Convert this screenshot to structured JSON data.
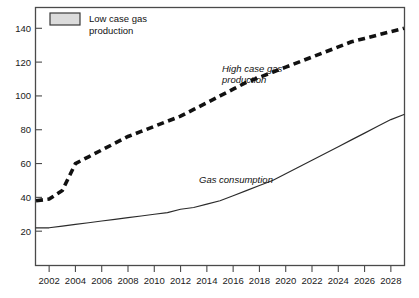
{
  "chart_data": {
    "type": "line",
    "title": "",
    "xlabel": "",
    "ylabel": "",
    "xlim": [
      2001,
      2029
    ],
    "ylim": [
      0,
      152
    ],
    "grid": false,
    "legend_position": "top-left",
    "x_ticks": [
      "2002",
      "2004",
      "2006",
      "2008",
      "2010",
      "2012",
      "2014",
      "2016",
      "2018",
      "2020",
      "2022",
      "2024",
      "2026",
      "2028"
    ],
    "x_tick_values": [
      2002,
      2004,
      2006,
      2008,
      2010,
      2012,
      2014,
      2016,
      2018,
      2020,
      2022,
      2024,
      2026,
      2028
    ],
    "y_ticks": [
      "20",
      "40",
      "60",
      "80",
      "100",
      "120",
      "140"
    ],
    "y_tick_values": [
      20,
      40,
      60,
      80,
      100,
      120,
      140
    ],
    "x": [
      2001,
      2002,
      2003,
      2004,
      2005,
      2006,
      2007,
      2008,
      2009,
      2010,
      2011,
      2012,
      2013,
      2014,
      2015,
      2016,
      2017,
      2018,
      2019,
      2020,
      2021,
      2022,
      2023,
      2024,
      2025,
      2026,
      2027,
      2028,
      2029
    ],
    "series": [
      {
        "name": "High case gas production",
        "style": "dashed",
        "color": "#111111",
        "annotation": "High case gas production",
        "values": [
          38,
          39,
          44,
          60,
          64,
          68,
          72,
          76,
          79,
          82,
          85,
          88,
          92,
          96,
          100,
          104,
          108,
          111,
          114,
          117,
          120,
          123,
          126,
          129,
          132,
          134,
          136,
          138,
          140
        ]
      },
      {
        "name": "Gas consumption",
        "style": "solid",
        "color": "#2b2b2b",
        "annotation": "Gas consumption",
        "values": [
          22,
          22,
          23,
          24,
          25,
          26,
          27,
          28,
          29,
          30,
          31,
          33,
          34,
          36,
          38,
          41,
          44,
          47,
          50,
          54,
          58,
          62,
          66,
          70,
          74,
          78,
          82,
          86,
          89
        ]
      }
    ],
    "legend": [
      {
        "label_line1": "Low case gas",
        "label_line2": "production",
        "swatch_fill": "#dcdcdc",
        "swatch_stroke": "#3a3a3a"
      }
    ],
    "annotations": [
      {
        "text_line1": "High case gas",
        "text_line2": "production"
      },
      {
        "text_line1": "Gas consumption",
        "text_line2": ""
      }
    ]
  }
}
